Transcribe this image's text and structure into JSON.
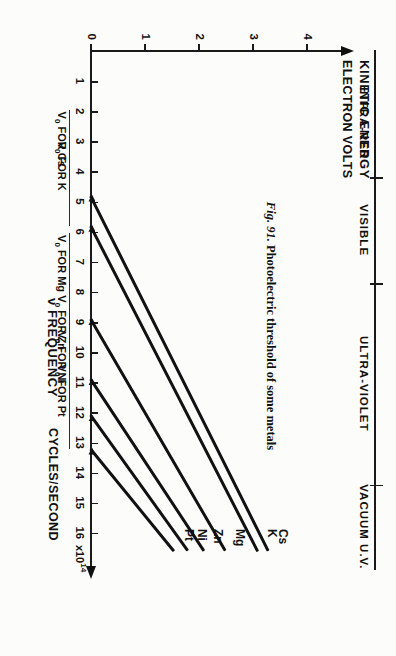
{
  "figure": {
    "caption_number": "Fig. 91.",
    "caption_text": "Photoelectric threshold of some metals"
  },
  "chart_data": {
    "type": "line",
    "title": "Photoelectric threshold of some metals",
    "xlabel": "ν FREQUENCY",
    "xunits": "CYCLES/SECOND",
    "x_exponent": "x10",
    "x_exponent_sup": "14",
    "ylabel_primary": "KINETIC ENERGY",
    "ylabel_secondary": "ELECTRON VOLTS",
    "xlim": [
      0,
      17
    ],
    "ylim": [
      0,
      4.6
    ],
    "grid": false,
    "legend": "inline-line-labels",
    "xticks": [
      1,
      2,
      3,
      4,
      5,
      6,
      7,
      8,
      9,
      10,
      11,
      12,
      13,
      14,
      15,
      16
    ],
    "yticks": [
      0,
      1,
      2,
      3,
      4
    ],
    "ytick_labels": [
      "0",
      "1",
      "2",
      "3",
      "4"
    ],
    "slope_note": "all lines share Planck slope h",
    "series": [
      {
        "name": "Cs",
        "label": "Cs",
        "threshold": 4.8,
        "threshold_label": "V₀ FOR Cs",
        "end_x": 16.6,
        "end_y": 3.3
      },
      {
        "name": "K",
        "label": "K",
        "threshold": 5.8,
        "threshold_label": "V₀ FOR K",
        "end_x": 16.6,
        "end_y": 3.1
      },
      {
        "name": "Mg",
        "label": "Mg",
        "threshold": 8.9,
        "threshold_label": "V₀ FOR Mg",
        "end_x": 16.6,
        "end_y": 2.5
      },
      {
        "name": "Zn",
        "label": "Zn",
        "threshold": 10.9,
        "threshold_label": "V₀ FOR Zn",
        "end_x": 16.6,
        "end_y": 2.1
      },
      {
        "name": "Ni",
        "label": "Ni",
        "threshold": 12.1,
        "threshold_label": "V₀ FOR Ni",
        "end_x": 16.6,
        "end_y": 1.8
      },
      {
        "name": "Pt",
        "label": "Pt",
        "threshold": 13.2,
        "threshold_label": "V₀ FOR Pt",
        "end_x": 16.6,
        "end_y": 1.55
      }
    ],
    "spectrum_bands": [
      {
        "name": "INFRA-RED",
        "start": 0.6,
        "end": 4.2
      },
      {
        "name": "VISIBLE",
        "start": 4.2,
        "end": 7.7
      },
      {
        "name": "ULTRA-VIOLET",
        "start": 7.7,
        "end": 14.4
      },
      {
        "name": "VACUUM U.V.",
        "start": 14.4,
        "end": 17.2
      }
    ]
  },
  "axis_titles": {
    "frequency_symbol": "ν",
    "frequency_word": "FREQUENCY",
    "frequency_units": "CYCLES/SECOND",
    "energy_word": "KINETIC ENERGY",
    "energy_units": "ELECTRON VOLTS"
  }
}
